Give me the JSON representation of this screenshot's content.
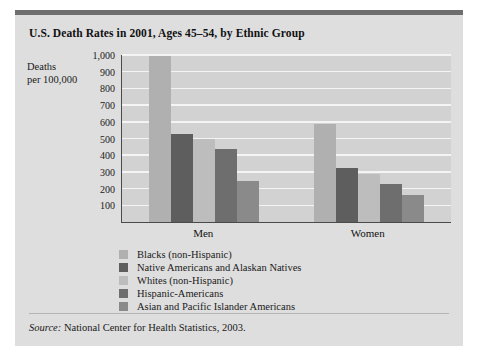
{
  "figure": {
    "title": "U.S. Death Rates in 2001, Ages 45–54, by Ethnic Group",
    "axis_title_line1": "Deaths",
    "axis_title_line2": "per 100,000",
    "source_label": "Source:",
    "source_text": " National Center for Health Statistics, 2003.",
    "panel_color": "#dedede",
    "plot_color": "#d2d2d2",
    "gridline_color": "#f4f4f4",
    "axis_color": "#4a4a4a",
    "top_rule_color": "#6e6e6e"
  },
  "chart_data": {
    "type": "bar",
    "title": "U.S. Death Rates in 2001, Ages 45–54, by Ethnic Group",
    "xlabel": "",
    "ylabel": "Deaths per 100,000",
    "categories": [
      "Men",
      "Women"
    ],
    "ylim": [
      0,
      1000
    ],
    "yticks": [
      100,
      200,
      300,
      400,
      500,
      600,
      700,
      800,
      900,
      1000
    ],
    "ytick_labels": [
      "100",
      "200",
      "300",
      "400",
      "500",
      "600",
      "700",
      "800",
      "900",
      "1,000"
    ],
    "grid": true,
    "legend_position": "below-plot",
    "series": [
      {
        "name": "Blacks (non-Hispanic)",
        "color": "#b0b0b0",
        "values": [
          995,
          585
        ]
      },
      {
        "name": "Native Americans and Alaskan Natives",
        "color": "#5e5e5e",
        "values": [
          530,
          325
        ]
      },
      {
        "name": "Whites (non-Hispanic)",
        "color": "#bdbdbd",
        "values": [
          500,
          285
        ]
      },
      {
        "name": "Hispanic-Americans",
        "color": "#6e6e6e",
        "values": [
          440,
          225
        ]
      },
      {
        "name": "Asian and Pacific Islander Americans",
        "color": "#8a8a8a",
        "values": [
          245,
          160
        ]
      }
    ]
  }
}
